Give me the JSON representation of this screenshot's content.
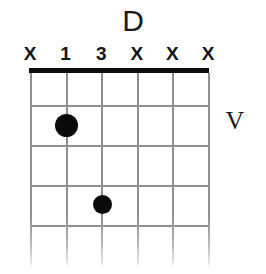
{
  "diagram": {
    "kind": "guitar-chord-diagram",
    "chord_name": "D",
    "position_marker": "V",
    "colors": {
      "ink": "#0d0d0d",
      "grid": "#909090",
      "background": "#ffffff"
    },
    "geometry": {
      "grid_left": 30,
      "grid_right": 208,
      "string_spacing": 35.6,
      "nut_y": 68,
      "nut_height": 5,
      "fret_spacing": 40,
      "grid_bottom": 268
    },
    "strings": [
      {
        "index": 1,
        "name": "string-6-low-e",
        "x": 30,
        "marker": "X"
      },
      {
        "index": 2,
        "name": "string-5-a",
        "x": 65.6,
        "marker": "1"
      },
      {
        "index": 3,
        "name": "string-4-d",
        "x": 101.2,
        "marker": "3"
      },
      {
        "index": 4,
        "name": "string-3-g",
        "x": 136.8,
        "marker": "X"
      },
      {
        "index": 5,
        "name": "string-2-b",
        "x": 172.4,
        "marker": "X"
      },
      {
        "index": 6,
        "name": "string-1-high-e",
        "x": 208,
        "marker": "X"
      }
    ],
    "frets": [
      {
        "index": 1,
        "y": 105
      },
      {
        "index": 2,
        "y": 145
      },
      {
        "index": 3,
        "y": 185
      },
      {
        "index": 4,
        "y": 225
      }
    ],
    "dots": [
      {
        "label": "finger-1",
        "string": 2,
        "fret": 2,
        "x": 65.6,
        "y": 125,
        "radius": 11.5
      },
      {
        "label": "finger-3",
        "string": 3,
        "fret": 4,
        "x": 101.2,
        "y": 204,
        "radius": 9.5
      }
    ]
  }
}
